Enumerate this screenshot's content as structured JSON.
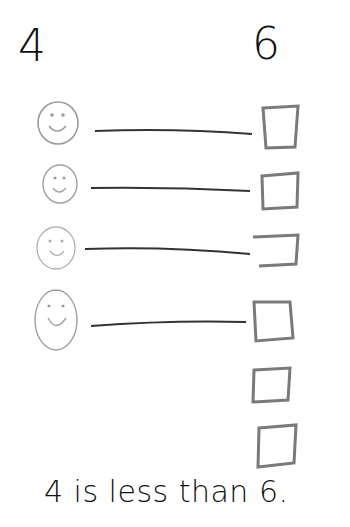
{
  "header": {
    "left_number": "4",
    "right_number": "6"
  },
  "rows": [
    {
      "face": "smiley-face",
      "line": true,
      "box": "square"
    },
    {
      "face": "smiley-face",
      "line": true,
      "box": "square"
    },
    {
      "face": "smiley-face",
      "line": true,
      "box": "square"
    },
    {
      "face": "smiley-face",
      "line": true,
      "box": "square"
    },
    {
      "face": null,
      "line": false,
      "box": "square"
    },
    {
      "face": null,
      "line": false,
      "box": "square"
    }
  ],
  "caption": {
    "text": "4 is less than 6."
  },
  "colors": {
    "ink": "#111111",
    "pencil_face": "#9a9a9a",
    "pencil_box": "#7a7a7a",
    "line": "#333333"
  }
}
